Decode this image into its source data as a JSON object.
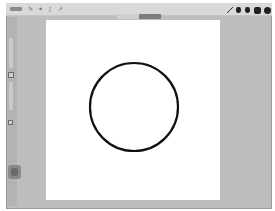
{
  "app": {
    "type": "drawing-app"
  },
  "topbar": {
    "gallery_label": "Gallery",
    "left_tools": [
      {
        "icon": "wrench-icon",
        "glyph": "✎"
      },
      {
        "icon": "magic-wand-icon",
        "glyph": "✦"
      },
      {
        "icon": "selection-icon",
        "glyph": "ʃ"
      },
      {
        "icon": "transform-icon",
        "glyph": "➚"
      }
    ],
    "right_tools": [
      {
        "icon": "brush-icon"
      },
      {
        "icon": "smudge-icon"
      },
      {
        "icon": "eraser-icon"
      },
      {
        "icon": "layers-icon"
      },
      {
        "icon": "color-icon"
      }
    ]
  },
  "segmented": {
    "options": [
      "",
      ""
    ],
    "selected_index": 1
  },
  "sidebar": {
    "sliders": [
      {
        "name": "brush-size-slider"
      },
      {
        "name": "opacity-slider"
      }
    ],
    "buttons": [
      {
        "name": "undo-button"
      },
      {
        "name": "redo-button"
      }
    ]
  },
  "canvas": {
    "background": "#ffffff",
    "shape": {
      "type": "circle",
      "cx": 88,
      "cy": 87,
      "r": 44,
      "stroke": "#111111",
      "stroke_width": 2.2
    }
  },
  "colors": {
    "frame": "#bdbdbd",
    "topbar": "#d9d9d9",
    "accent_dark": "#222222"
  }
}
